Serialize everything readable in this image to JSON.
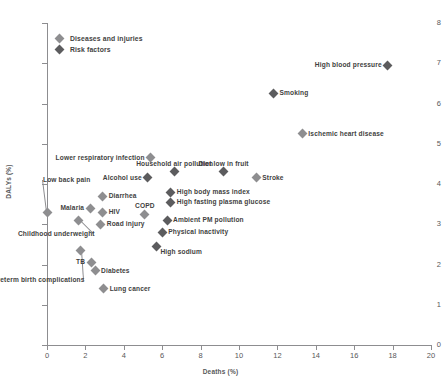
{
  "chart_data": {
    "type": "scatter",
    "title": "",
    "xlabel": "Deaths (%)",
    "ylabel": "DALYs (%)",
    "xlim": [
      0,
      20
    ],
    "ylim": [
      0,
      8
    ],
    "xticks": [
      0,
      2,
      4,
      6,
      8,
      10,
      12,
      14,
      16,
      18,
      20
    ],
    "yticks": [
      0,
      1,
      2,
      3,
      4,
      5,
      6,
      7,
      8
    ],
    "grid": false,
    "legend_position": "top-left",
    "legend": [
      {
        "name": "Diseases and injuries",
        "color": "#8e8e90"
      },
      {
        "name": "Risk factors",
        "color": "#5c5c5e"
      }
    ],
    "series": [
      {
        "name": "Diseases and injuries",
        "color": "#8e8e90",
        "points": [
          {
            "label": "Ischemic heart disease",
            "x": 13.3,
            "y": 5.25,
            "label_pos": "right"
          },
          {
            "label": "Stroke",
            "x": 10.9,
            "y": 4.15,
            "label_pos": "right"
          },
          {
            "label": "Lower respiratory infection",
            "x": 5.4,
            "y": 4.65,
            "label_pos": "left"
          },
          {
            "label": "Low back pain",
            "x": 0.0,
            "y": 3.3,
            "label_pos": "leader"
          },
          {
            "label": "Diarrhea",
            "x": 2.9,
            "y": 3.7,
            "label_pos": "right"
          },
          {
            "label": "Malaria",
            "x": 2.25,
            "y": 3.4,
            "label_pos": "left"
          },
          {
            "label": "HIV",
            "x": 2.9,
            "y": 3.3,
            "label_pos": "right"
          },
          {
            "label": "COPD",
            "x": 5.1,
            "y": 3.25,
            "label_pos": "above"
          },
          {
            "label": "Road injury",
            "x": 2.8,
            "y": 3.0,
            "label_pos": "right"
          },
          {
            "label": "Childhood underweight",
            "x": 1.65,
            "y": 3.1,
            "label_pos": "leader"
          },
          {
            "label": "Preterm birth complications",
            "x": 1.75,
            "y": 2.35,
            "label_pos": "leader"
          },
          {
            "label": "TB",
            "x": 2.3,
            "y": 2.05,
            "label_pos": "left"
          },
          {
            "label": "Diabetes",
            "x": 2.5,
            "y": 1.85,
            "label_pos": "right"
          },
          {
            "label": "Lung cancer",
            "x": 2.95,
            "y": 1.4,
            "label_pos": "right"
          }
        ]
      },
      {
        "name": "Risk factors",
        "color": "#5c5c5e",
        "points": [
          {
            "label": "High blood pressure",
            "x": 17.75,
            "y": 6.95,
            "label_pos": "left"
          },
          {
            "label": "Smoking",
            "x": 11.8,
            "y": 6.25,
            "label_pos": "right"
          },
          {
            "label": "Household air pollution",
            "x": 6.65,
            "y": 4.3,
            "label_pos": "above"
          },
          {
            "label": "Diet low in fruit",
            "x": 9.2,
            "y": 4.3,
            "label_pos": "above"
          },
          {
            "label": "Alcohol use",
            "x": 5.25,
            "y": 4.15,
            "label_pos": "left"
          },
          {
            "label": "High body mass index",
            "x": 6.45,
            "y": 3.8,
            "label_pos": "right"
          },
          {
            "label": "High fasting plasma glucose",
            "x": 6.45,
            "y": 3.55,
            "label_pos": "right"
          },
          {
            "label": "Ambient PM pollution",
            "x": 6.25,
            "y": 3.1,
            "label_pos": "right"
          },
          {
            "label": "Physical inactivity",
            "x": 6.0,
            "y": 2.8,
            "label_pos": "right"
          },
          {
            "label": "High sodium",
            "x": 5.7,
            "y": 2.45,
            "label_pos": "right"
          }
        ]
      }
    ]
  }
}
